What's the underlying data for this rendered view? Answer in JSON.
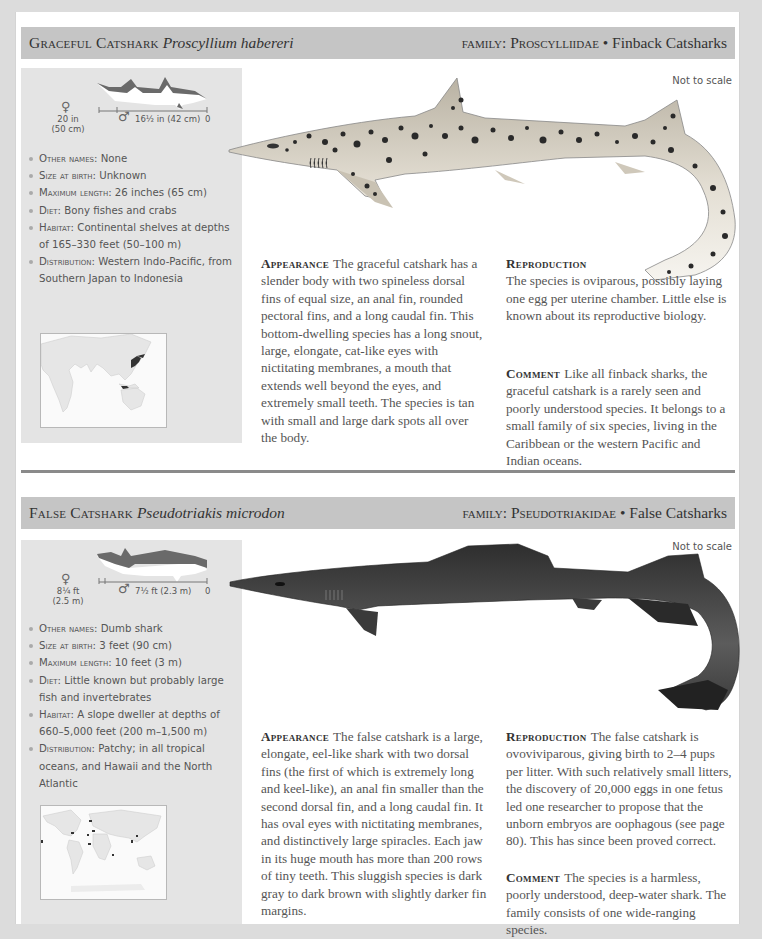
{
  "entries": [
    {
      "common_name": "Graceful Catshark",
      "latin_name": "Proscyllium habereri",
      "family_label": "family:",
      "family_name": "Proscylliidae",
      "family_separator": "•",
      "family_common": "Finback Catsharks",
      "size_diagram": {
        "female_symbol": "♀",
        "female_size": "20 in",
        "female_size_metric": "(50 cm)",
        "male_symbol": "♂",
        "male_size": "16½ in (42 cm)",
        "zero": "0"
      },
      "facts": [
        {
          "key": "Other names:",
          "value": "None"
        },
        {
          "key": "Size at birth:",
          "value": "Unknown"
        },
        {
          "key": "Maximum length:",
          "value": "26 inches (65 cm)"
        },
        {
          "key": "Diet:",
          "value": "Bony fishes and crabs"
        },
        {
          "key": "Habitat:",
          "value": "Continental shelves at depths of 165–330 feet (50–100 m)"
        },
        {
          "key": "Distribution:",
          "value": "Western Indo-Pacific, from Southern Japan to Indonesia"
        }
      ],
      "map_label": "range-map-indo-pacific",
      "not_to_scale": "Not to scale",
      "appearance_label": "Appearance",
      "appearance_text": "The graceful catshark has a slender body with two spineless dorsal fins of equal size, an anal fin, rounded pectoral fins, and a long caudal fin. This bottom-dwelling species has a long snout, large, elongate, cat-like eyes with nictitating membranes, a mouth that extends well beyond the eyes, and extremely small teeth. The species is tan with small and large dark spots all over the body.",
      "reproduction_label": "Reproduction",
      "reproduction_text": "The species is oviparous, possibly laying one egg per uterine chamber. Little else is known about its reproductive biology.",
      "comment_label": "Comment",
      "comment_text": "Like all finback sharks, the graceful catshark is a rarely seen and poorly understood species. It belongs to a small family of six species, living in the Caribbean or the western Pacific and Indian oceans."
    },
    {
      "common_name": "False Catshark",
      "latin_name": "Pseudotriakis microdon",
      "family_label": "family:",
      "family_name": "Pseudotriakidae",
      "family_separator": "•",
      "family_common": "False Catsharks",
      "size_diagram": {
        "female_symbol": "♀",
        "female_size": "8¼ ft",
        "female_size_metric": "(2.5 m)",
        "male_symbol": "♂",
        "male_size": "7½ ft (2.3 m)",
        "zero": "0"
      },
      "facts": [
        {
          "key": "Other names:",
          "value": "Dumb shark"
        },
        {
          "key": "Size at birth:",
          "value": "3 feet (90 cm)"
        },
        {
          "key": "Maximum length:",
          "value": "10 feet (3 m)"
        },
        {
          "key": "Diet:",
          "value": "Little known but probably large fish and invertebrates"
        },
        {
          "key": "Habitat:",
          "value": "A slope dweller at depths of 660–5,000 feet (200 m–1,500 m)"
        },
        {
          "key": "Distribution:",
          "value": "Patchy; in all tropical oceans, and Hawaii and the North Atlantic"
        }
      ],
      "map_label": "range-map-world",
      "not_to_scale": "Not to scale",
      "appearance_label": "Appearance",
      "appearance_text": "The false catshark is a large, elongate, eel-like shark with two dorsal fins (the first of which is extremely long and keel-like), an anal fin smaller than the second dorsal fin, and a long caudal fin. It has oval eyes with nictitating membranes, and distinctively large spiracles. Each jaw in its huge mouth has more than 200 rows of tiny teeth. This sluggish species is dark gray to dark brown with slightly darker fin margins.",
      "reproduction_label": "Reproduction",
      "reproduction_text": "The false catshark is ovoviviparous, giving birth to 2–4 pups per litter. With such relatively small litters, the discovery of 20,000 eggs in one fetus led one researcher to propose that the unborn embryos are oophagous (see page 80). This has since been proved correct.",
      "comment_label": "Comment",
      "comment_text": "The species is a harmless, poorly understood, deep-water shark. The family consists of one wide-ranging species."
    }
  ],
  "colors": {
    "header_bar": "#c5c5c5",
    "panel": "#e4e4e4",
    "separator": "#8a8a8a",
    "spot": "#2a2a2a",
    "graceful_body": "#d9d3c6",
    "false_body": "#4a4a4a"
  }
}
